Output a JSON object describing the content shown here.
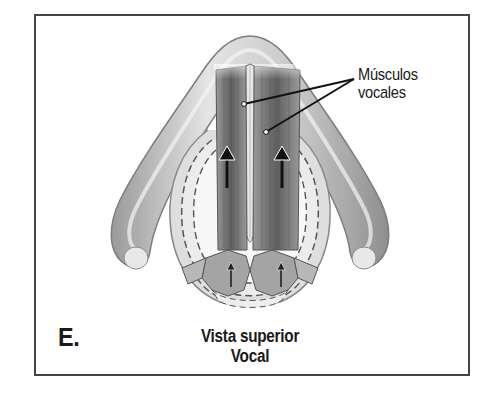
{
  "figure": {
    "panel_letter": "E.",
    "caption": {
      "line1": "Vista superior",
      "line2": "Vocal"
    },
    "labels": [
      {
        "text_line1": "Músculos",
        "text_line2": "vocales",
        "points_to": [
          "left-vocal-muscle",
          "right-vocal-muscle"
        ]
      }
    ],
    "arrows": [
      {
        "name": "left-muscle-arrow",
        "direction": "up"
      },
      {
        "name": "right-muscle-arrow",
        "direction": "up"
      },
      {
        "name": "left-cartilage-arrow",
        "direction": "up"
      },
      {
        "name": "right-cartilage-arrow",
        "direction": "up"
      }
    ],
    "colors": {
      "border": "#444444",
      "cartilage_light": "#d9d9d9",
      "cartilage_mid": "#b5b5b5",
      "muscle_dark": "#6e6e6e",
      "muscle_mid": "#8c8c8c",
      "text": "#1a1a1a"
    }
  }
}
